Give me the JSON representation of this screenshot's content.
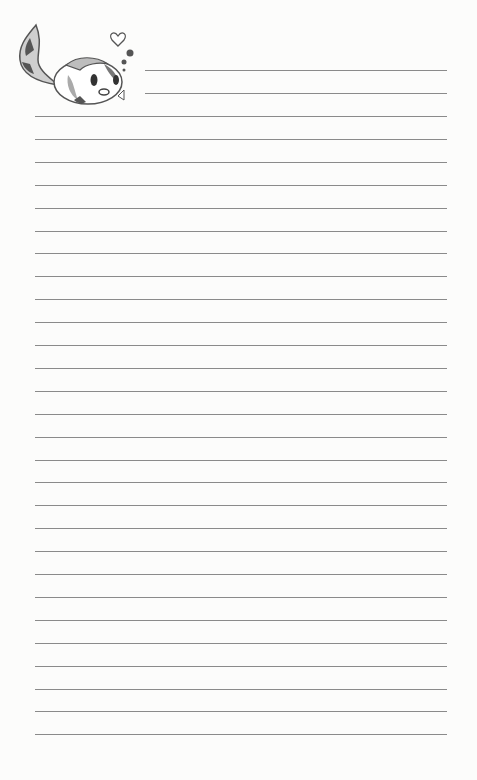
{
  "page": {
    "type": "lined-notepaper",
    "background_color": "#fcfcfb",
    "line_color": "#8a8a8a"
  },
  "illustration": {
    "icon": "cartoon-fish-with-heart-and-bubbles-icon"
  },
  "lines": {
    "short_count": 2,
    "full_count": 28,
    "first_short_y": 70,
    "first_full_y": 116,
    "spacing": 22.9,
    "short_x_start": 145,
    "full_x_start": 35,
    "x_end": 447
  }
}
